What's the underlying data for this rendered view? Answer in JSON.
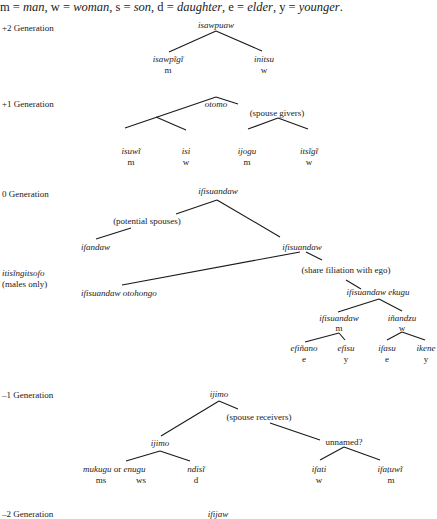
{
  "legend": {
    "m": "m",
    "m_val": "man",
    "w": "w",
    "w_val": "woman",
    "s": "s",
    "s_val": "son",
    "d": "d",
    "d_val": "daughter",
    "e": "e",
    "e_val": "elder",
    "y": "y",
    "y_val": "younger"
  },
  "generations": {
    "plus2": {
      "label": "+2 Generation",
      "root": "isawpuaw",
      "children": [
        {
          "term": "isawpĩgĩ",
          "sex": "m"
        },
        {
          "term": "initsu",
          "sex": "w"
        }
      ]
    },
    "plus1": {
      "label": "+1 Generation",
      "root": "otomo",
      "note": "(spouse givers)",
      "children": [
        {
          "term": "isuwĩ",
          "sex": "m"
        },
        {
          "term": "isi",
          "sex": "w"
        },
        {
          "term": "ijogu",
          "sex": "m"
        },
        {
          "term": "itsĩgĩ",
          "sex": "w"
        }
      ]
    },
    "zero": {
      "label": "0 Generation",
      "root": "ifisuandaw",
      "note_spouses": "(potential spouses)",
      "ifandaw": "ifandaw",
      "ifisuandaw2": "ifisuandaw",
      "side_term": "itisĩngitsofo",
      "side_note": "(males only)",
      "otohongo": "ifisuandaw otohongo",
      "note_filiation": "(share filiation with ego)",
      "ekugu": "ifisuandaw ekugu",
      "m_branch": {
        "term": "ifisuandaw",
        "sex": "m"
      },
      "w_branch": {
        "term": "iñandzu",
        "sex": "w"
      },
      "leaves": [
        {
          "term": "efiñano",
          "rel": "e"
        },
        {
          "term": "efisu",
          "rel": "y"
        },
        {
          "term": "ifasu",
          "rel": "e"
        },
        {
          "term": "ikene",
          "rel": "y"
        }
      ]
    },
    "minus1": {
      "label": "–1 Generation",
      "root": "ijimo",
      "note": "(spouse receivers)",
      "ijimo2": "ijimo",
      "unnamed": "unnamed?",
      "mukugu": "mukugu",
      "or": "or",
      "enugu": "enugu",
      "ms": "ms",
      "ws": "ws",
      "ndisi": "ndisĩ",
      "d": "d",
      "ifati": {
        "term": "ifati",
        "sex": "w"
      },
      "ifatuwi": {
        "term": "ifaṭuwĩ",
        "sex": "m"
      }
    },
    "minus2": {
      "label": "–2 Generation",
      "root": "ifijaw"
    }
  }
}
